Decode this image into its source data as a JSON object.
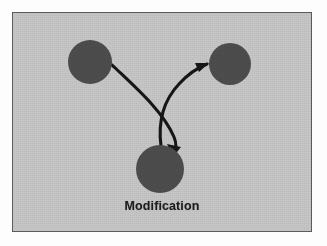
{
  "figure": {
    "caption": "Modification",
    "panel": {
      "background_color": "#c7c7c7",
      "border_color": "#5b5b5b",
      "width": 300,
      "height": 220
    },
    "nodes": [
      {
        "id": "node-top-left",
        "label": "",
        "cx": 77,
        "cy": 49,
        "r": 22,
        "color": "#4d4d4d"
      },
      {
        "id": "node-top-right",
        "label": "",
        "cx": 217,
        "cy": 51,
        "r": 21,
        "color": "#4d4d4d"
      },
      {
        "id": "node-bottom",
        "label": "Modification",
        "cx": 147,
        "cy": 156,
        "r": 24,
        "color": "#4d4d4d"
      }
    ],
    "edges": [
      {
        "id": "edge-top-left-to-bottom",
        "from": "node-top-left",
        "to": "node-bottom",
        "style": "curved-arrow",
        "color": "#161616"
      },
      {
        "id": "edge-bottom-to-top-right",
        "from": "node-bottom",
        "to": "node-top-right",
        "style": "curved-arrow",
        "color": "#161616"
      }
    ]
  }
}
